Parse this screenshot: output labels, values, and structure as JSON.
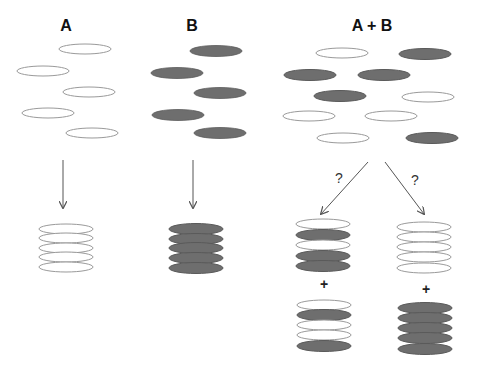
{
  "labels": {
    "a": "A",
    "b": "B",
    "ab": "A + B",
    "question_left": "?",
    "question_right": "?",
    "plus_left": "+",
    "plus_right": "+"
  },
  "colors": {
    "open_stroke": "#9a9a9a",
    "filled": "#6e6e6e",
    "filled_stroke": "#5a5a5a",
    "arrow": "#555555"
  },
  "panels": [
    {
      "name": "A",
      "discs": [
        "open",
        "open",
        "open",
        "open",
        "open"
      ],
      "stack": [
        "open",
        "open",
        "open",
        "open",
        "open"
      ]
    },
    {
      "name": "B",
      "discs": [
        "filled",
        "filled",
        "filled",
        "filled",
        "filled"
      ],
      "stack": [
        "filled",
        "filled",
        "filled",
        "filled",
        "filled"
      ]
    },
    {
      "name": "A + B",
      "discs": [
        "open",
        "filled",
        "filled",
        "filled",
        "filled",
        "open",
        "open",
        "open",
        "open",
        "filled"
      ],
      "outcome_left": {
        "top": [
          "open",
          "filled",
          "open",
          "filled",
          "filled"
        ],
        "bottom": [
          "open",
          "filled",
          "open",
          "open",
          "filled"
        ]
      },
      "outcome_right": {
        "top": [
          "open",
          "open",
          "open",
          "open",
          "open"
        ],
        "bottom": [
          "filled",
          "filled",
          "filled",
          "filled",
          "filled"
        ]
      }
    }
  ]
}
